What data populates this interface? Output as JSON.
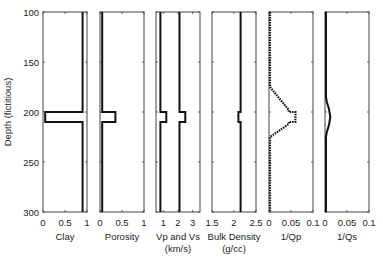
{
  "chart_data": {
    "type": "line",
    "title": "",
    "ylabel": "Depth (fictitious)",
    "ylim": [
      100,
      300
    ],
    "y_reversed": true,
    "yticks": [
      100,
      150,
      200,
      250,
      300
    ],
    "grid": false,
    "legend": null,
    "panels": [
      {
        "xlabel": "Clay",
        "xlabel2": "",
        "xlim": [
          0,
          1
        ],
        "xticks": [
          "0",
          "0.5",
          "1"
        ],
        "xtick_values": [
          0,
          0.5,
          1
        ],
        "series": [
          {
            "name": "Clay",
            "points": [
              [
                0.9,
                100
              ],
              [
                0.9,
                200
              ],
              [
                0.05,
                200
              ],
              [
                0.05,
                210
              ],
              [
                0.9,
                210
              ],
              [
                0.9,
                300
              ]
            ]
          }
        ]
      },
      {
        "xlabel": "Porosity",
        "xlabel2": "",
        "xlim": [
          0,
          1
        ],
        "xticks": [
          "0",
          "0.5",
          "1"
        ],
        "xtick_values": [
          0,
          0.5,
          1
        ],
        "series": [
          {
            "name": "Porosity",
            "points": [
              [
                0.05,
                100
              ],
              [
                0.05,
                200
              ],
              [
                0.35,
                200
              ],
              [
                0.35,
                210
              ],
              [
                0.05,
                210
              ],
              [
                0.05,
                300
              ]
            ]
          }
        ]
      },
      {
        "xlabel": "Vp and Vs",
        "xlabel2": "(km/s)",
        "xlim": [
          0.5,
          3.5
        ],
        "xticks": [
          "1",
          "2",
          "3"
        ],
        "xtick_values": [
          1,
          2,
          3
        ],
        "series": [
          {
            "name": "Vs",
            "points": [
              [
                0.8,
                100
              ],
              [
                0.8,
                200
              ],
              [
                1.2,
                200
              ],
              [
                1.2,
                210
              ],
              [
                0.8,
                210
              ],
              [
                0.8,
                300
              ]
            ]
          },
          {
            "name": "Vp",
            "points": [
              [
                2.1,
                100
              ],
              [
                2.1,
                200
              ],
              [
                2.5,
                200
              ],
              [
                2.5,
                210
              ],
              [
                2.1,
                210
              ],
              [
                2.1,
                300
              ]
            ]
          }
        ]
      },
      {
        "xlabel": "Bulk Density",
        "xlabel2": "(g/cc)",
        "xlim": [
          1.5,
          2.5
        ],
        "xticks": [
          "1.5",
          "2",
          "2.5"
        ],
        "xtick_values": [
          1.5,
          2,
          2.5
        ],
        "series": [
          {
            "name": "Bulk Density",
            "points": [
              [
                2.15,
                100
              ],
              [
                2.15,
                200
              ],
              [
                2.1,
                200
              ],
              [
                2.1,
                210
              ],
              [
                2.15,
                210
              ],
              [
                2.15,
                300
              ]
            ]
          }
        ]
      },
      {
        "xlabel": "1/Qp",
        "xlabel2": "",
        "xlim": [
          0,
          0.1
        ],
        "xticks": [
          "0",
          "0.05",
          "0.1"
        ],
        "xtick_values": [
          0,
          0.05,
          0.1
        ],
        "series": [
          {
            "name": "1/Qp",
            "dotted": true,
            "points": [
              [
                0.001,
                100
              ],
              [
                0.001,
                175
              ],
              [
                0.045,
                198
              ],
              [
                0.045,
                200
              ],
              [
                0.06,
                200
              ],
              [
                0.06,
                210
              ],
              [
                0.045,
                210
              ],
              [
                0.045,
                212
              ],
              [
                0.001,
                225
              ],
              [
                0.001,
                300
              ]
            ]
          }
        ]
      },
      {
        "xlabel": "1/Qs",
        "xlabel2": "",
        "xlim": [
          0,
          0.1
        ],
        "xticks": [
          "0",
          "0.05",
          "0.1"
        ],
        "xtick_values": [
          0,
          0.05,
          0.1
        ],
        "series": [
          {
            "name": "1/Qs",
            "smooth": true,
            "points": [
              [
                0.001,
                100
              ],
              [
                0.001,
                185
              ],
              [
                0.004,
                190
              ],
              [
                0.009,
                197
              ],
              [
                0.012,
                205
              ],
              [
                0.009,
                213
              ],
              [
                0.004,
                220
              ],
              [
                0.001,
                225
              ],
              [
                0.001,
                300
              ]
            ]
          }
        ]
      }
    ]
  }
}
